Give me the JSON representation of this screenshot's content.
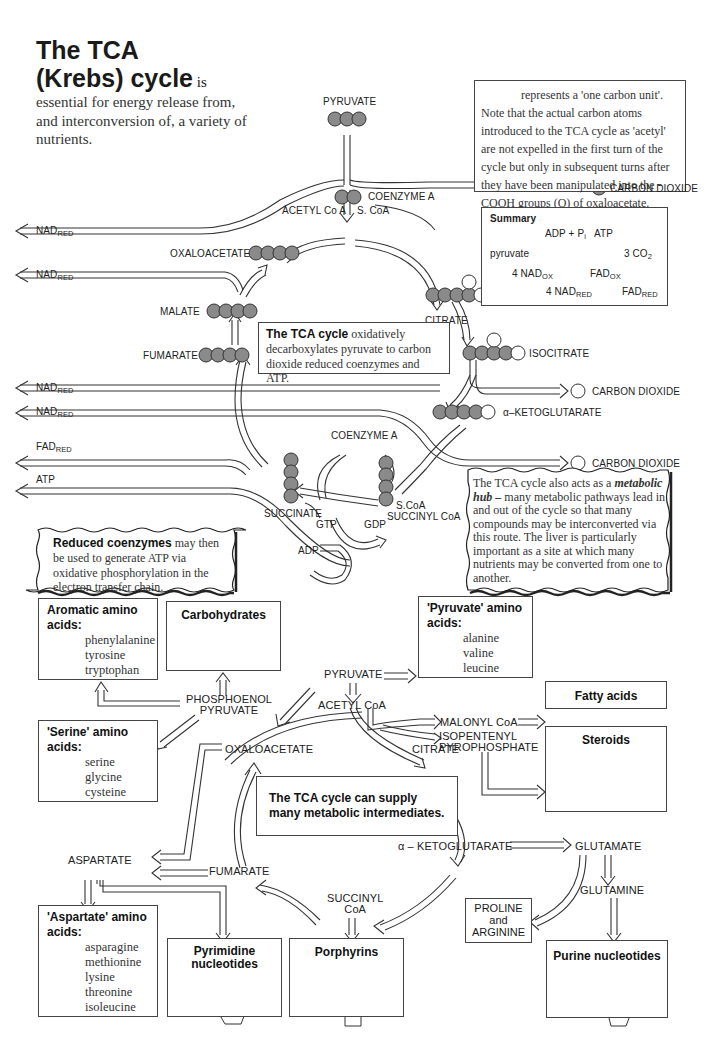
{
  "title": {
    "heading_line1": "The TCA",
    "heading_line2": "(Krebs) cycle",
    "heading_tail": " is",
    "intro": "essential for energy release from, and interconversion of, a variety of nutrients."
  },
  "carbon_note": {
    "icon": "grey-circle-icon",
    "text": "represents a 'one carbon unit'. Note that the actual carbon atoms introduced to the TCA cycle as 'acetyl' are not expelled in the first turn of the cycle but only in subsequent turns after they have been manipulated into the -COOH groups (O) of oxaloacetate."
  },
  "upper_cycle": {
    "pyruvate": "PYRUVATE",
    "acetyl_coa": "ACETYL Co A",
    "s_coa": "S. CoA",
    "coenzyme_a_top": "COENZYME A",
    "carbon_dioxide_1": "CARBON DIOXIDE",
    "citrate": "CITRATE",
    "isocitrate": "ISOCITRATE",
    "carbon_dioxide_2": "CARBON DIOXIDE",
    "alpha_ketoglutarate": "α–KETOGLUTARATE",
    "carbon_dioxide_3": "CARBON DIOXIDE",
    "coenzyme_a_bottom": "COENZYME A",
    "s_coa_2": "S.CoA",
    "succinyl_coa": "SUCCINYL CoA",
    "succinate": "SUCCINATE",
    "gtp": "GTP",
    "gdp": "GDP",
    "adp": "ADP",
    "fumarate": "FUMARATE",
    "malate": "MALATE",
    "oxaloacetate": "OXALOACETATE",
    "outputs": [
      {
        "base": "NAD",
        "sub": "RED"
      },
      {
        "base": "NAD",
        "sub": "RED"
      },
      {
        "base": "NAD",
        "sub": "RED"
      },
      {
        "base": "NAD",
        "sub": "RED"
      },
      {
        "base": "FAD",
        "sub": "RED"
      },
      {
        "base": "ATP",
        "sub": ""
      }
    ]
  },
  "summary_box": {
    "heading": "Summary",
    "adp_pi": "ADP + P",
    "pi_sub": "i",
    "atp": "ATP",
    "pyruvate": "pyruvate",
    "co2": "3 CO",
    "co2_sub": "2",
    "nad_ox": "4 NAD",
    "nad_ox_sub": "OX",
    "nad_red": "4 NAD",
    "nad_red_sub": "RED",
    "fad_ox": "FAD",
    "fad_ox_sub": "OX",
    "fad_red": "FAD",
    "fad_red_sub": "RED"
  },
  "center_box": {
    "bold": "The TCA cycle",
    "text": " oxidatively decarboxylates pyruvate to carbon dioxide reduced coenzymes and ATP."
  },
  "reduced_coenzymes_note": {
    "bold": "Reduced coenzymes",
    "text": " may then be used to generate ATP via oxidative phosphorylation in the electron transfer chain."
  },
  "metabolic_hub_note": {
    "lead": "The TCA cycle also acts as a ",
    "bold_italic": "metabolic hub –",
    "text": " many metabolic pathways lead in and out of the cycle so that many compounds may be interconverted via this route. The liver is particularly important as a site at which many nutrients may be converted from one to another."
  },
  "lower_diagram": {
    "pyruvate": "PYRUVATE",
    "acetyl_coa": "ACETYL CoA",
    "phosphoenol_pyruvate_1": "PHOSPHOENOL",
    "phosphoenol_pyruvate_2": "PYRUVATE",
    "malonyl_coa": "MALONYL CoA",
    "isopentenyl_1": "ISOPENTENYL",
    "isopentenyl_2": "PYROPHOSPHATE",
    "oxaloacetate": "OXALOACETATE",
    "citrate": "CITRATE",
    "aspartate": "ASPARTATE",
    "fumarate": "FUMARATE",
    "alpha_ketoglutarate": "α – KETOGLUTARATE",
    "glutamate": "GLUTAMATE",
    "glutamine": "GLUTAMINE",
    "succinyl_coa_1": "SUCCINYL",
    "succinyl_coa_2": "CoA",
    "center_note": "The TCA cycle can supply many metabolic intermediates.",
    "boxes": {
      "aromatic": {
        "heading": "Aromatic amino acids:",
        "items": [
          "phenylalanine",
          "tyrosine",
          "tryptophan"
        ]
      },
      "carbohydrates": {
        "heading": "Carbohydrates"
      },
      "pyruvate_aa": {
        "heading": "'Pyruvate' amino acids:",
        "items": [
          "alanine",
          "valine",
          "leucine"
        ]
      },
      "fatty_acids": {
        "heading": "Fatty acids"
      },
      "steroids": {
        "heading": "Steroids"
      },
      "serine_aa": {
        "heading": "'Serine' amino acids:",
        "items": [
          "serine",
          "glycine",
          "cysteine"
        ]
      },
      "aspartate_aa": {
        "heading": "'Aspartate' amino acids:",
        "items": [
          "asparagine",
          "methionine",
          "lysine",
          "threonine",
          "isoleucine"
        ]
      },
      "pyrimidine": {
        "heading": "Pyrimidine nucleotides"
      },
      "porphyrins": {
        "heading": "Porphyrins"
      },
      "proline_arginine": {
        "line1": "PROLINE",
        "line2": "and",
        "line3": "ARGININE"
      },
      "purine": {
        "heading": "Purine nucleotides"
      }
    }
  },
  "colors": {
    "carbon_fill": "#8a8a8a",
    "line": "#333333",
    "background": "#ffffff"
  }
}
